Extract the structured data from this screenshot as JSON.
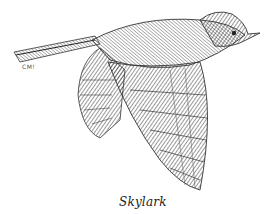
{
  "caption": "Skylark",
  "signature": "CM!",
  "illustration": {
    "subject": "skylark-in-flight",
    "style": "pen-and-ink",
    "colors": {
      "ink": "#2a2a2a",
      "paper": "#ffffff"
    }
  }
}
